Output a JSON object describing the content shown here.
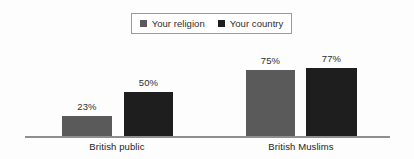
{
  "chart_data": {
    "type": "bar",
    "title": "",
    "subtitle": "",
    "xlabel": "",
    "ylabel": "",
    "ylim": [
      0,
      100
    ],
    "grid": false,
    "legend_position": "top-center",
    "categories": [
      "British public",
      "British Muslims"
    ],
    "series": [
      {
        "name": "Your religion",
        "color": "#5a5a5a",
        "values": [
          23,
          50
        ],
        "labels": [
          "23%",
          "50%"
        ]
      },
      {
        "name": "Your country",
        "color": "#1e1e1e",
        "values": [
          50,
          77
        ],
        "labels": [
          "50%",
          "77%"
        ]
      }
    ],
    "bars": [
      {
        "group": "British public",
        "series": "Your religion",
        "value": 23,
        "label": "23%",
        "color": "#5a5a5a"
      },
      {
        "group": "British public",
        "series": "Your country",
        "value": 50,
        "label": "50%",
        "color": "#1e1e1e"
      },
      {
        "group": "British Muslims",
        "series": "Your religion",
        "value": 75,
        "label": "75%",
        "color": "#5a5a5a"
      },
      {
        "group": "British Muslims",
        "series": "Your country",
        "value": 77,
        "label": "77%",
        "color": "#1e1e1e"
      }
    ]
  },
  "legend": {
    "items": [
      {
        "label": "Your religion",
        "color": "#5a5a5a"
      },
      {
        "label": "Your country",
        "color": "#1e1e1e"
      }
    ]
  },
  "axis": {
    "baseline_color": "#8e8e8e"
  },
  "bars": [
    {
      "label": "23%",
      "group_index": 0
    },
    {
      "label": "50%",
      "group_index": 0
    },
    {
      "label": "75%",
      "group_index": 1
    },
    {
      "label": "77%",
      "group_index": 1
    }
  ],
  "group_labels": [
    {
      "label": "British public"
    },
    {
      "label": "British Muslims"
    }
  ]
}
